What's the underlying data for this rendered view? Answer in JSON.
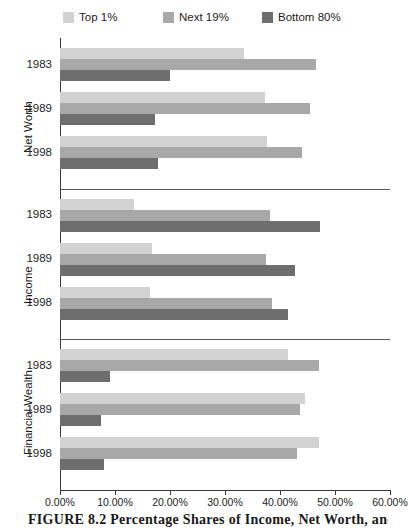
{
  "legend": {
    "items": [
      {
        "label": "Top 1%",
        "color": "#d2d2d2",
        "left": 63
      },
      {
        "label": "Next 19%",
        "color": "#a8a8a8",
        "left": 163
      },
      {
        "label": "Bottom 80%",
        "color": "#6e6e6e",
        "left": 262
      }
    ]
  },
  "axis": {
    "x_ticks": [
      "0.00%",
      "10.00%",
      "20.00%",
      "30.00%",
      "40.00%",
      "50.00%",
      "60.00%"
    ],
    "x_min": 0,
    "x_max": 60
  },
  "sections": [
    {
      "name": "Net Worth",
      "years": [
        "1983",
        "1989",
        "1998"
      ]
    },
    {
      "name": "Income",
      "years": [
        "1983",
        "1989",
        "1998"
      ]
    },
    {
      "name": "Financial Wealth",
      "years": [
        "1983",
        "1989",
        "1998"
      ]
    }
  ],
  "caption": {
    "text": "FIGURE 8.2   Percentage Shares of Income, Net Worth, and Financial Wealth"
  },
  "chart_data": {
    "type": "bar",
    "orientation": "horizontal",
    "title": "",
    "xlabel": "",
    "ylabel": "",
    "xlim": [
      0,
      60
    ],
    "grid": false,
    "legend_position": "top",
    "categories": [
      "Net Worth 1983",
      "Net Worth 1989",
      "Net Worth 1998",
      "Income 1983",
      "Income 1989",
      "Income 1998",
      "Financial Wealth 1983",
      "Financial Wealth 1989",
      "Financial Wealth 1998"
    ],
    "series": [
      {
        "name": "Top 1%",
        "color": "#d2d2d2",
        "values": [
          33.4,
          37.3,
          37.7,
          13.5,
          16.7,
          16.4,
          41.5,
          44.5,
          47.0
        ]
      },
      {
        "name": "Next 19%",
        "color": "#a8a8a8",
        "values": [
          46.6,
          45.5,
          44.0,
          38.2,
          37.5,
          38.5,
          47.0,
          43.6,
          43.0
        ]
      },
      {
        "name": "Bottom 80%",
        "color": "#6e6e6e",
        "values": [
          20.0,
          17.3,
          17.8,
          47.3,
          42.7,
          41.5,
          9.1,
          7.5,
          8.0
        ]
      }
    ],
    "groups": [
      {
        "group": "Net Worth",
        "rows": [
          {
            "year": "1983",
            "Top 1%": 33.4,
            "Next 19%": 46.6,
            "Bottom 80%": 20.0
          },
          {
            "year": "1989",
            "Top 1%": 37.3,
            "Next 19%": 45.5,
            "Bottom 80%": 17.3
          },
          {
            "year": "1998",
            "Top 1%": 37.7,
            "Next 19%": 44.0,
            "Bottom 80%": 17.8
          }
        ]
      },
      {
        "group": "Income",
        "rows": [
          {
            "year": "1983",
            "Top 1%": 13.5,
            "Next 19%": 38.2,
            "Bottom 80%": 47.3
          },
          {
            "year": "1989",
            "Top 1%": 16.7,
            "Next 19%": 37.5,
            "Bottom 80%": 42.7
          },
          {
            "year": "1998",
            "Top 1%": 16.4,
            "Next 19%": 38.5,
            "Bottom 80%": 41.5
          }
        ]
      },
      {
        "group": "Financial Wealth",
        "rows": [
          {
            "year": "1983",
            "Top 1%": 41.5,
            "Next 19%": 47.0,
            "Bottom 80%": 9.1
          },
          {
            "year": "1989",
            "Top 1%": 44.5,
            "Next 19%": 43.6,
            "Bottom 80%": 7.5
          },
          {
            "year": "1998",
            "Top 1%": 47.0,
            "Next 19%": 43.0,
            "Bottom 80%": 8.0
          }
        ]
      }
    ]
  }
}
